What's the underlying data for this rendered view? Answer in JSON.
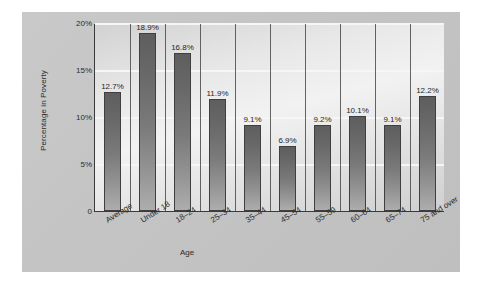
{
  "chart_data": {
    "type": "bar",
    "title": "",
    "xlabel": "Age",
    "ylabel": "Percentage in Poverty",
    "categories": [
      "Average",
      "Under 18",
      "18–24",
      "25–34",
      "35–44",
      "45–54",
      "55–59",
      "60–64",
      "65–74",
      "75 and over"
    ],
    "values": [
      12.7,
      18.9,
      16.8,
      11.9,
      9.1,
      6.9,
      9.2,
      10.1,
      9.1,
      12.2
    ],
    "value_labels": [
      "12.7%",
      "18.9%",
      "16.8%",
      "11.9%",
      "9.1%",
      "6.9%",
      "9.2%",
      "10.1%",
      "9.1%",
      "12.2%"
    ],
    "ylim": [
      0,
      20
    ],
    "ytick_values": [
      0,
      5,
      10,
      15,
      20
    ],
    "ytick_labels": [
      "0",
      "5%",
      "10%",
      "15%",
      "20%"
    ],
    "grid": true,
    "legend": false,
    "legend_position": "none",
    "bar_color": "#7a7a7a",
    "plot_background": "#eeeeee",
    "panel_background": "#c4c4c4",
    "axis_color": "#3a3a3a",
    "gridline_color": "#f6f6f6",
    "text_color": "#2b2b2b"
  }
}
